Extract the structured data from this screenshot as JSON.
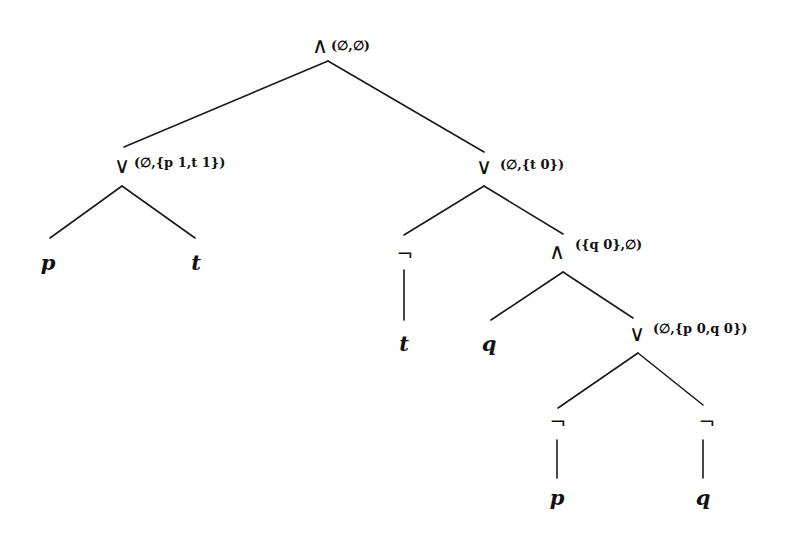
{
  "diagram": {
    "type": "formula-parse-tree",
    "nodes": [
      {
        "id": "root",
        "label": "∧",
        "annotation": "(∅,∅)",
        "x": 320,
        "y": 46,
        "ann_x": 332,
        "ann_y": 45
      },
      {
        "id": "or_left",
        "label": "∨",
        "annotation": "(∅,{p 1,t 1})",
        "x": 122,
        "y": 166,
        "ann_x": 134,
        "ann_y": 162
      },
      {
        "id": "or_right",
        "label": "∨",
        "annotation": "(∅,{t 0})",
        "x": 484,
        "y": 167,
        "ann_x": 500,
        "ann_y": 164
      },
      {
        "id": "leaf_p1",
        "label": "p",
        "x": 48,
        "y": 262
      },
      {
        "id": "leaf_t1",
        "label": "t",
        "x": 196,
        "y": 262
      },
      {
        "id": "not_t",
        "label": "¬",
        "x": 405,
        "y": 254
      },
      {
        "id": "and_inner",
        "label": "∧",
        "annotation": "({q 0},∅)",
        "x": 557,
        "y": 252,
        "ann_x": 575,
        "ann_y": 244
      },
      {
        "id": "leaf_t2",
        "label": "t",
        "x": 404,
        "y": 343
      },
      {
        "id": "leaf_q1",
        "label": "q",
        "x": 489,
        "y": 343
      },
      {
        "id": "or_inner",
        "label": "∨",
        "annotation": "(∅,{p 0,q 0})",
        "x": 637,
        "y": 334,
        "ann_x": 653,
        "ann_y": 328
      },
      {
        "id": "not_p",
        "label": "¬",
        "x": 558,
        "y": 422
      },
      {
        "id": "not_q",
        "label": "¬",
        "x": 707,
        "y": 422
      },
      {
        "id": "leaf_p2",
        "label": "p",
        "x": 557,
        "y": 497
      },
      {
        "id": "leaf_q2",
        "label": "q",
        "x": 703,
        "y": 497
      }
    ],
    "edges": [
      {
        "from": "root",
        "to": "or_left",
        "x1": 328,
        "y1": 61,
        "x2": 124,
        "y2": 147
      },
      {
        "from": "root",
        "to": "or_right",
        "x1": 328,
        "y1": 61,
        "x2": 484,
        "y2": 152
      },
      {
        "from": "or_left",
        "to": "leaf_p1",
        "x1": 122,
        "y1": 186,
        "x2": 50,
        "y2": 238
      },
      {
        "from": "or_left",
        "to": "leaf_t1",
        "x1": 122,
        "y1": 186,
        "x2": 195,
        "y2": 238
      },
      {
        "from": "or_right",
        "to": "not_t",
        "x1": 484,
        "y1": 186,
        "x2": 404,
        "y2": 235
      },
      {
        "from": "or_right",
        "to": "and_inner",
        "x1": 484,
        "y1": 186,
        "x2": 563,
        "y2": 234
      },
      {
        "from": "not_t",
        "to": "leaf_t2",
        "x1": 404,
        "y1": 270,
        "x2": 404,
        "y2": 320
      },
      {
        "from": "and_inner",
        "to": "leaf_q1",
        "x1": 563,
        "y1": 272,
        "x2": 491,
        "y2": 320
      },
      {
        "from": "and_inner",
        "to": "or_inner",
        "x1": 563,
        "y1": 272,
        "x2": 633,
        "y2": 318
      },
      {
        "from": "or_inner",
        "to": "not_p",
        "x1": 638,
        "y1": 353,
        "x2": 558,
        "y2": 408
      },
      {
        "from": "or_inner",
        "to": "not_q",
        "x1": 638,
        "y1": 353,
        "x2": 703,
        "y2": 405
      },
      {
        "from": "not_p",
        "to": "leaf_p2",
        "x1": 557,
        "y1": 440,
        "x2": 557,
        "y2": 478
      },
      {
        "from": "not_q",
        "to": "leaf_q2",
        "x1": 703,
        "y1": 440,
        "x2": 703,
        "y2": 478
      }
    ]
  },
  "labels": {
    "root_op": "∧",
    "root_ann": "(∅,∅)",
    "or_left_op": "∨",
    "or_left_ann": "(∅,{p 1,t 1})",
    "or_right_op": "∨",
    "or_right_ann": "(∅,{t 0})",
    "leaf_p1": "p",
    "leaf_t1": "t",
    "not_t_op": "¬",
    "and_inner_op": "∧",
    "and_inner_ann": "({q 0},∅)",
    "leaf_t2": "t",
    "leaf_q1": "q",
    "or_inner_op": "∨",
    "or_inner_ann": "(∅,{p 0,q 0})",
    "not_p_op": "¬",
    "not_q_op": "¬",
    "leaf_p2": "p",
    "leaf_q2": "q"
  },
  "colors": {
    "background": "#ffffff",
    "ink": "#111111"
  }
}
